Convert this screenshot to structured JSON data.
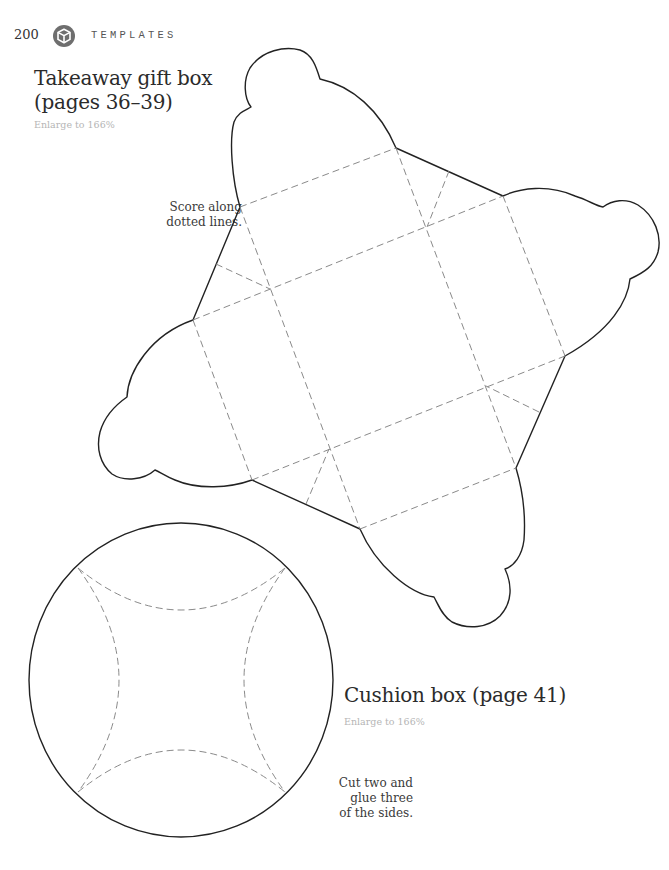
{
  "header": {
    "page_number": "200",
    "chapter_icon": "cube-icon",
    "chapter_title": "TEMPLATES"
  },
  "takeaway_box": {
    "title_line1": "Takeaway gift box",
    "title_line2": "(pages 36–39)",
    "enlarge": "Enlarge to 166%",
    "note_line1": "Score along",
    "note_line2": "dotted lines."
  },
  "cushion_box": {
    "title": "Cushion box (page 41)",
    "enlarge": "Enlarge to 166%",
    "note_line1": "Cut two and",
    "note_line2": "glue three",
    "note_line3": "of the sides."
  },
  "colors": {
    "cut_line": "#222222",
    "score_line": "#8a8a8a",
    "icon_fill": "#6e6e6e",
    "muted_text": "#b5b5b5"
  }
}
